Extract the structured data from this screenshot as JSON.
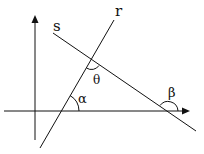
{
  "diagram": {
    "title": "",
    "labels": {
      "line_r": "r",
      "line_s": "s",
      "angle_theta": "θ",
      "angle_alpha": "α",
      "angle_beta": "β"
    },
    "colors": {
      "stroke": "#111111",
      "background": "#ffffff"
    },
    "elements": [
      {
        "id": "y-axis",
        "type": "arrow",
        "from": [
          35,
          140
        ],
        "to": [
          35,
          16
        ]
      },
      {
        "id": "x-axis",
        "type": "arrow",
        "from": [
          4,
          111
        ],
        "to": [
          190,
          111
        ]
      },
      {
        "id": "line-r",
        "type": "line",
        "from": [
          40,
          148
        ],
        "to": [
          114,
          20
        ]
      },
      {
        "id": "line-s",
        "type": "line",
        "from": [
          53,
          33
        ],
        "to": [
          196,
          131
        ]
      },
      {
        "id": "angle-theta",
        "type": "arc",
        "vertex": [
          91,
          60
        ]
      },
      {
        "id": "angle-alpha",
        "type": "arc",
        "vertex": [
          61,
          111
        ]
      },
      {
        "id": "angle-beta",
        "type": "arc",
        "vertex": [
          168,
          111
        ]
      }
    ]
  }
}
